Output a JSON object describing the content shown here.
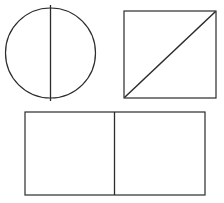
{
  "figure": {
    "background_color": "#ffffff",
    "stroke_color": "#2b2b2b",
    "width": 224,
    "height": 203,
    "shapes": [
      {
        "id": "circle-with-diameter",
        "name": "Circle divided by a vertical diameter",
        "type": "circle",
        "center_x": 50.5,
        "center_y": 53,
        "radius": 45,
        "divider": {
          "type": "line",
          "orientation": "vertical",
          "x1": 50.5,
          "y1": 5,
          "x2": 50.5,
          "y2": 101
        }
      },
      {
        "id": "square-with-diagonal",
        "name": "Square divided by a diagonal",
        "type": "rect",
        "x": 124,
        "y": 11,
        "width": 92,
        "height": 87,
        "divider": {
          "type": "line",
          "orientation": "diagonal",
          "x1": 125,
          "y1": 97,
          "x2": 215,
          "y2": 12
        }
      },
      {
        "id": "rectangle-with-vertical-divider",
        "name": "Rectangle divided into two halves",
        "type": "rect",
        "x": 25,
        "y": 112,
        "width": 180,
        "height": 83,
        "divider": {
          "type": "line",
          "orientation": "vertical",
          "x1": 114.5,
          "y1": 112,
          "x2": 114.5,
          "y2": 195
        }
      }
    ]
  }
}
